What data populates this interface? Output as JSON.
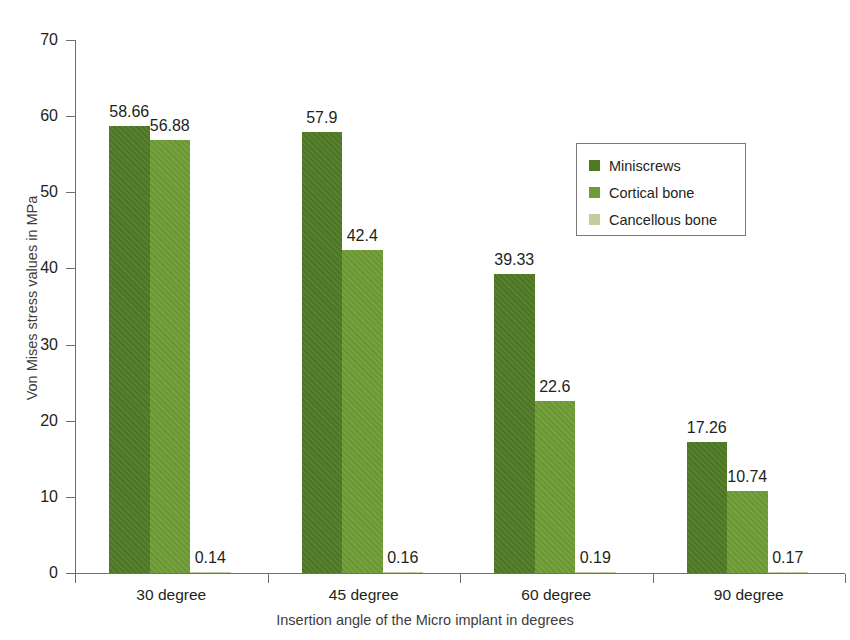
{
  "page": {
    "artifact_text": "",
    "background_color": "#ffffff"
  },
  "chart_data": {
    "type": "bar",
    "title": "",
    "xlabel": "Insertion angle of the Micro implant in degrees",
    "ylabel": "Von Mises stress values in MPa",
    "categories": [
      "30 degree",
      "45 degree",
      "60 degree",
      "90 degree"
    ],
    "series": [
      {
        "name": "Miniscrews",
        "color": "#4F7A24",
        "values": [
          58.66,
          57.9,
          39.33,
          17.26
        ],
        "labels": [
          "58.66",
          "57.9",
          "39.33",
          "17.26"
        ]
      },
      {
        "name": "Cortical bone",
        "color": "#6E9C36",
        "values": [
          56.88,
          42.4,
          22.6,
          10.74
        ],
        "labels": [
          "56.88",
          "42.4",
          "22.6",
          "10.74"
        ]
      },
      {
        "name": "Cancellous bone",
        "color": "#C3CDA0",
        "values": [
          0.14,
          0.16,
          0.19,
          0.17
        ],
        "labels": [
          "0.14",
          "0.16",
          "0.19",
          "0.17"
        ]
      }
    ],
    "ylim": [
      0,
      70
    ],
    "yticks": [
      0,
      10,
      20,
      30,
      40,
      50,
      60,
      70
    ],
    "ytick_labels": [
      "0",
      "10",
      "20",
      "30",
      "40",
      "50",
      "60",
      "70"
    ],
    "grid": false,
    "legend_position": "upper right",
    "legend_entries": [
      "Miniscrews",
      "Cortical bone",
      "Cancellous bone"
    ],
    "axis_color": "#6f6f6f",
    "text_color": "#231f20"
  }
}
